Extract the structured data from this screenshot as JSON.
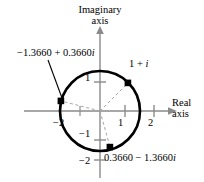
{
  "figure": {
    "kind": "complex-plane-diagram",
    "background_color": "#ffffff",
    "stroke_color": "#000000",
    "axis_color": "#808080",
    "dashed_color": "#9a9a9a"
  },
  "axes": {
    "imaginary_title_line1": "Imaginary",
    "imaginary_title_line2": "axis",
    "real_title_line1": "Real",
    "real_title_line2": "axis",
    "real_ticks": [
      "−2",
      "1",
      "2"
    ],
    "imaginary_ticks": [
      "1",
      "−1",
      "−2"
    ]
  },
  "circle": {
    "center_real": 0,
    "center_imag": 0,
    "radius_units": 1.4142,
    "center_px": [
      100,
      111
    ],
    "radius_px": 40
  },
  "points": [
    {
      "id": "one-plus-i",
      "label": "1 + i",
      "label_prefix": "1 + ",
      "label_italic": "i",
      "real": 1.0,
      "imag": 1.0,
      "angle_deg": 45,
      "marker_px": [
        128,
        83
      ]
    },
    {
      "id": "root-upper-left",
      "label": "−1.3660 + 0.3660i",
      "label_prefix": "−1.3660 + 0.3660",
      "label_italic": "i",
      "real": -1.366,
      "imag": 0.366,
      "angle_deg": 165,
      "marker_px": [
        61,
        101
      ]
    },
    {
      "id": "root-lower-right",
      "label": "0.3660 − 1.3660i",
      "label_prefix": "0.3660 − 1.3660",
      "label_italic": "i",
      "real": 0.366,
      "imag": -1.366,
      "angle_deg": 285,
      "marker_px": [
        110,
        147
      ]
    }
  ],
  "leader_line": {
    "from_px": [
      48,
      60
    ],
    "to_px": [
      62,
      98
    ]
  }
}
